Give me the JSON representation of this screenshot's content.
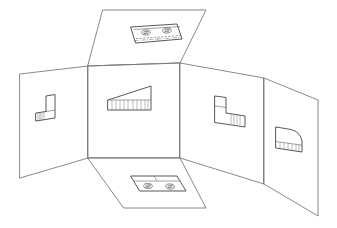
{
  "figure": {
    "background_color": "#ffffff",
    "line_color": "#3a3a3a",
    "fold_line_color": "#7a7a7a",
    "width": 337,
    "height": 228
  },
  "panels": [
    {
      "id": "top-panel",
      "view_name": "top-view",
      "label": "Top view",
      "position": "upper-center",
      "outline": "103,10 206,10 180,63 88,66",
      "feature_count": 2,
      "features": [
        "circular-boss-left",
        "circular-boss-right"
      ]
    },
    {
      "id": "front-panel",
      "view_name": "front-view",
      "label": "Front view",
      "position": "center",
      "outline": "88,66 180,63 180,158 88,158",
      "feature_count": 1,
      "features": [
        "angled-top-profile",
        "ribbed-base"
      ]
    },
    {
      "id": "left-panel",
      "view_name": "left-side-view",
      "label": "Left side view",
      "position": "left",
      "outline": "20,74 88,66 88,158 20,178",
      "feature_count": 1,
      "features": [
        "l-shaped-profile"
      ]
    },
    {
      "id": "right-panel",
      "view_name": "right-side-view",
      "label": "Right side view",
      "position": "right-inner",
      "outline": "180,63 264,78 264,184 180,158",
      "feature_count": 1,
      "features": [
        "mirrored-l-shaped-profile"
      ]
    },
    {
      "id": "rear-panel",
      "view_name": "rear-view",
      "label": "Rear view",
      "position": "right-outer",
      "outline": "264,78 318,100 318,216 264,184",
      "feature_count": 1,
      "features": [
        "curved-top-profile",
        "ribbed-base"
      ]
    },
    {
      "id": "bottom-panel",
      "view_name": "bottom-view",
      "label": "Bottom view",
      "position": "lower-center",
      "outline": "88,158 180,158 206,208 124,208",
      "feature_count": 2,
      "features": [
        "circular-boss-left",
        "circular-boss-right"
      ]
    }
  ],
  "views": {
    "top": {
      "name": "top-view-detail",
      "plate_outline": "131,27 177,24 182,39 136,43",
      "hole_left": {
        "cx": 146,
        "cy": 32,
        "rx": 3.4,
        "ry": 2.0
      },
      "hole_right": {
        "cx": 167,
        "cy": 30,
        "rx": 3.4,
        "ry": 2.0
      },
      "has_hidden_lines": true,
      "has_center_line": true
    },
    "front": {
      "name": "front-view-detail",
      "outline": "108,100 150,86 151,86 151,109 108,109",
      "base_band_top_y": 99,
      "rib_count": 10,
      "has_ribs": true
    },
    "left": {
      "name": "left-side-view-detail",
      "outline": "35,113 46,111 46,95 54,94 54,118 35,121",
      "hatch_count": 3
    },
    "right": {
      "name": "right-side-view-detail",
      "outline": "215,96 226,97 226,113 244,117 244,127 215,122",
      "hatch_count": 4
    },
    "rear": {
      "name": "rear-view-detail",
      "outline": "276,127 300,131 302,144 302,152 276,147",
      "rib_count": 6,
      "has_curved_top": true
    },
    "bottom": {
      "name": "bottom-view-detail",
      "plate_outline": "131,176 177,176 186,191 140,192",
      "divider_line": "154,176 163,191",
      "hole_left": {
        "cx": 148,
        "cy": 186,
        "rx": 3.4,
        "ry": 2.0
      },
      "hole_right": {
        "cx": 170,
        "cy": 186,
        "rx": 3.4,
        "ry": 2.0
      }
    }
  }
}
